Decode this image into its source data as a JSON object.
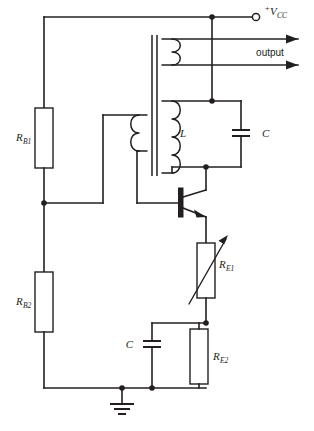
{
  "diagram": {
    "background_color": "#ffffff",
    "line_color": "#231f20"
  },
  "labels": {
    "supply_sign": "+",
    "supply_name": "V",
    "supply_subscript": "CC",
    "output": "output",
    "inductor_tank": "L",
    "capacitor_tank": "C",
    "resistor_b1_name": "R",
    "resistor_b1_subscript": "B1",
    "resistor_b2_name": "R",
    "resistor_b2_subscript": "B2",
    "resistor_e1_name": "R",
    "resistor_e1_subscript": "E1",
    "resistor_e2_name": "R",
    "resistor_e2_subscript": "E2",
    "capacitor_bypass": "C"
  },
  "components": [
    {
      "id": "rb1",
      "type": "resistor",
      "label": "RB1",
      "orientation": "vertical"
    },
    {
      "id": "rb2",
      "type": "resistor",
      "label": "RB2",
      "orientation": "vertical"
    },
    {
      "id": "re1",
      "type": "variable-resistor",
      "label": "RE1",
      "orientation": "vertical"
    },
    {
      "id": "re2",
      "type": "resistor",
      "label": "RE2",
      "orientation": "vertical"
    },
    {
      "id": "c-tank",
      "type": "capacitor",
      "label": "C",
      "orientation": "vertical"
    },
    {
      "id": "c-bypass",
      "type": "capacitor",
      "label": "C",
      "orientation": "vertical"
    },
    {
      "id": "l-tank",
      "type": "inductor",
      "label": "L",
      "turns": 4
    },
    {
      "id": "transformer",
      "type": "transformer",
      "windings": 3
    },
    {
      "id": "q1",
      "type": "npn-transistor"
    },
    {
      "id": "gnd",
      "type": "ground"
    },
    {
      "id": "vcc",
      "type": "terminal-open"
    }
  ]
}
